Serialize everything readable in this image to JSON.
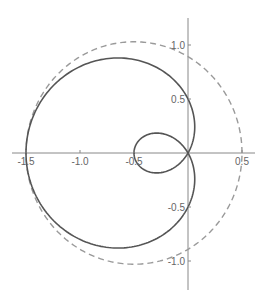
{
  "chart_data": {
    "type": "line",
    "title": "",
    "xlabel": "",
    "ylabel": "",
    "xlim": [
      -1.55,
      0.55
    ],
    "ylim": [
      -1.2,
      1.2
    ],
    "x_ticks": [
      "-1.5",
      "-1.0",
      "-0.5",
      "0.5"
    ],
    "y_ticks": [
      "1.0",
      "0.5",
      "-0.5",
      "-1.0"
    ],
    "grid": false,
    "series": [
      {
        "name": "limacon r = 0.5 - cos(theta)",
        "style": "solid",
        "color": "#555555",
        "key_points": [
          [
            -1.5,
            0
          ],
          [
            -0.6,
            0.88
          ],
          [
            0,
            0.5
          ],
          [
            0,
            0
          ],
          [
            0.25,
            0.2
          ],
          [
            0.5,
            0
          ],
          [
            0,
            -0.5
          ],
          [
            -0.6,
            -0.88
          ]
        ]
      },
      {
        "name": "circle center (-0.5,0) radius 1",
        "style": "dashed",
        "color": "#999999",
        "key_points": [
          [
            -1.5,
            0
          ],
          [
            -0.5,
            1
          ],
          [
            0.5,
            0
          ],
          [
            -0.5,
            -1
          ]
        ]
      }
    ]
  }
}
